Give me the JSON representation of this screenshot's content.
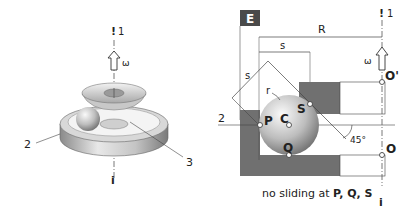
{
  "left_figure": {
    "axis_label_top": "1",
    "axis_marker_top": "!",
    "axis_marker_bottom": "i",
    "omega": "ω",
    "part_labels": [
      "2",
      "3"
    ]
  },
  "right_figure": {
    "panel_tag": "E",
    "dim_R": "R",
    "dim_s_horizontal": "s",
    "dim_s_diagonal": "s",
    "radius_label": "r",
    "axis_label_top": "1",
    "axis_marker_top": "!",
    "axis_marker_bottom": "i",
    "omega": "ω",
    "line_label": "2",
    "points": {
      "P": "P",
      "C": "C",
      "Q": "Q",
      "S": "S",
      "O": "O",
      "O_prime": "O'"
    },
    "angle": "45°",
    "caption_prefix": "no sliding at ",
    "caption_points": "P, Q, S"
  },
  "colors": {
    "race_fill": "#6e6e6e",
    "line": "#333333",
    "tag_bg": "#4a4a4a"
  }
}
